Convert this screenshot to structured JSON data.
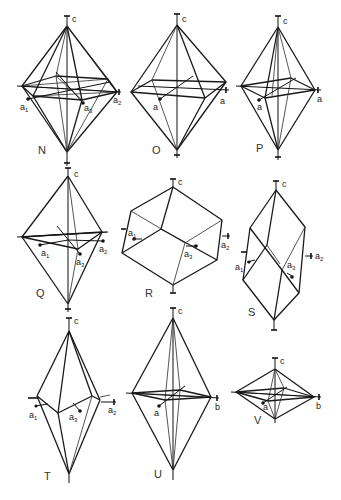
{
  "figure": {
    "background": "#ffffff",
    "line_color": "#1a1a1a",
    "panels": [
      {
        "id": "N",
        "label": "N",
        "type": "hexagonal-bipyramid",
        "axes": [
          "c",
          "a1",
          "a2",
          "a3"
        ]
      },
      {
        "id": "O",
        "label": "O",
        "type": "tetragonal-bipyramid",
        "axes": [
          "c",
          "a",
          "a"
        ]
      },
      {
        "id": "P",
        "label": "P",
        "type": "tetragonal-bipyramid",
        "axes": [
          "c",
          "a",
          "a"
        ]
      },
      {
        "id": "Q",
        "label": "Q",
        "type": "trigonal-bipyramid",
        "axes": [
          "c",
          "a1",
          "a2",
          "a3"
        ]
      },
      {
        "id": "R",
        "label": "R",
        "type": "rhombohedron-obtuse",
        "axes": [
          "c",
          "a1",
          "a2",
          "a3"
        ]
      },
      {
        "id": "S",
        "label": "S",
        "type": "rhombohedron-acute",
        "axes": [
          "c",
          "a1",
          "a2",
          "a3"
        ]
      },
      {
        "id": "T",
        "label": "T",
        "type": "scalenohedron",
        "axes": [
          "c",
          "a1",
          "a2",
          "a3"
        ]
      },
      {
        "id": "U",
        "label": "U",
        "type": "orthorhombic-bipyramid",
        "axes": [
          "c",
          "a",
          "b"
        ]
      },
      {
        "id": "V",
        "label": "V",
        "type": "orthorhombic-bipyramid",
        "axes": [
          "c",
          "a",
          "b"
        ]
      }
    ]
  },
  "labels": {
    "c": "c",
    "a": "a",
    "b": "b",
    "a_base": "a",
    "sub1": "1",
    "sub2": "2",
    "sub3": "3"
  },
  "panel_labels": {
    "N": "N",
    "O": "O",
    "P": "P",
    "Q": "Q",
    "R": "R",
    "S": "S",
    "T": "T",
    "U": "U",
    "V": "V"
  }
}
